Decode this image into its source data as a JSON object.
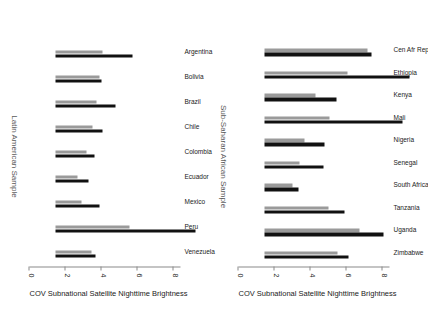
{
  "figure": {
    "orientation_degrees": 90,
    "axis_title": "COV Subnational Satellite Nighttime Brightness",
    "axis_ticks": [
      0,
      2,
      4,
      6,
      8
    ],
    "axis_min": 0,
    "axis_max": 8.4,
    "series_colors": {
      "gray": "#9a9a9a",
      "black": "#111111"
    }
  },
  "chart_data": [
    {
      "type": "bar",
      "title": "Sub-Saharan African Sample",
      "xlabel": "",
      "ylabel": "COV Subnational Satellite Nighttime Brightness",
      "ylim": [
        0,
        8.4
      ],
      "ticks": [
        0,
        2,
        4,
        6,
        8
      ],
      "grid": false,
      "legend": "none",
      "categories": [
        "Cen Afr Rep",
        "Ethiopia",
        "Kenya",
        "Mali",
        "Nigeria",
        "Senegal",
        "South Africa",
        "Tanzania",
        "Uganda",
        "Zimbabwe"
      ],
      "series": [
        {
          "name": "gray",
          "color": "#9a9a9a",
          "values": [
            5.75,
            4.6,
            2.85,
            3.6,
            2.2,
            1.95,
            1.55,
            3.55,
            5.3,
            4.05
          ]
        },
        {
          "name": "black",
          "color": "#111111",
          "values": [
            5.95,
            8.05,
            4.0,
            7.7,
            3.35,
            3.3,
            1.9,
            4.45,
            6.6,
            4.7
          ]
        }
      ]
    },
    {
      "type": "bar",
      "title": "Latin American Sample",
      "xlabel": "",
      "ylabel": "COV Subnational Satellite Nighttime Brightness",
      "ylim": [
        0,
        8.4
      ],
      "ticks": [
        0,
        2,
        4,
        6,
        8
      ],
      "grid": false,
      "legend": "none",
      "categories": [
        "Argentina",
        "Bolivia",
        "Brazil",
        "Chile",
        "Colombia",
        "Ecuador",
        "Mexico",
        "Peru",
        "Venezuela"
      ],
      "series": [
        {
          "name": "gray",
          "color": "#9a9a9a",
          "values": [
            2.6,
            2.45,
            2.3,
            2.05,
            1.7,
            1.25,
            1.45,
            4.1,
            2.0
          ]
        },
        {
          "name": "black",
          "color": "#111111",
          "values": [
            4.3,
            2.55,
            3.35,
            2.6,
            2.15,
            1.85,
            2.45,
            7.8,
            2.2
          ]
        }
      ]
    }
  ]
}
